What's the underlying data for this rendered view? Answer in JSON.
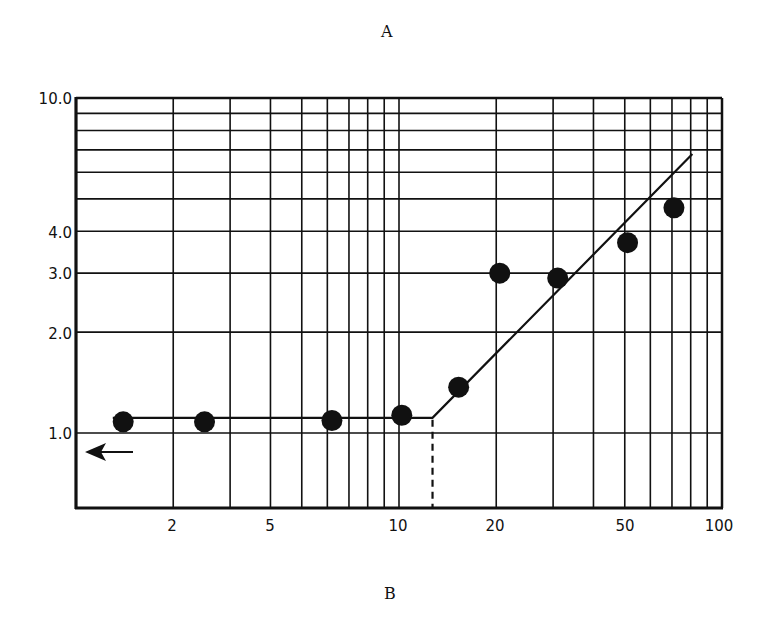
{
  "panel_labels": {
    "top": "A",
    "bottom": "B"
  },
  "colors": {
    "ink": "#111111",
    "background": "#ffffff"
  },
  "chart_data": {
    "type": "scatter",
    "title": "A",
    "xlabel": "B",
    "ylabel": "",
    "xscale": "log",
    "yscale": "log",
    "xlim": [
      1,
      100
    ],
    "ylim": [
      0.6,
      10.0
    ],
    "grid": true,
    "legend": null,
    "x_tick_labels": [
      "2",
      "5",
      "10",
      "20",
      "50",
      "100"
    ],
    "y_tick_labels": [
      "1.0",
      "2.0",
      "3.0",
      "4.0",
      "10.0"
    ],
    "x_grid_values": [
      2,
      3,
      4,
      5,
      6,
      7,
      8,
      9,
      10,
      20,
      30,
      40,
      50,
      60,
      70,
      80,
      90,
      100
    ],
    "y_grid_values": [
      1,
      2,
      3,
      4,
      5,
      6,
      7,
      8,
      9,
      10
    ],
    "series": [
      {
        "name": "data points",
        "marker": "filled-circle",
        "x": [
          1.4,
          2.5,
          6.2,
          10.2,
          15.3,
          20.5,
          31,
          51,
          71
        ],
        "y": [
          1.08,
          1.08,
          1.09,
          1.13,
          1.37,
          3.0,
          2.9,
          3.7,
          4.7
        ]
      },
      {
        "name": "fitted line",
        "style": "solid",
        "x": [
          1.3,
          12.7,
          81
        ],
        "y": [
          1.11,
          1.11,
          6.8
        ]
      },
      {
        "name": "breakpoint marker",
        "style": "dashed-vertical",
        "x": [
          12.7,
          12.7
        ],
        "y": [
          0.6,
          1.11
        ]
      }
    ],
    "annotations": [
      {
        "type": "arrow",
        "direction": "left",
        "x": 1.4,
        "y": 0.93
      }
    ]
  }
}
